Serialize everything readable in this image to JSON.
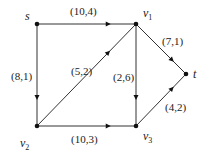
{
  "diagram": {
    "type": "flow-network",
    "nodes": [
      {
        "id": "s",
        "label": "s",
        "sub": "",
        "x": 37,
        "y": 24,
        "lx": 25,
        "ly": 20
      },
      {
        "id": "v1",
        "label": "v",
        "sub": "1",
        "x": 136,
        "y": 24,
        "lx": 143,
        "ly": 17
      },
      {
        "id": "t",
        "label": "t",
        "sub": "",
        "x": 186,
        "y": 74,
        "lx": 193,
        "ly": 78
      },
      {
        "id": "v2",
        "label": "v",
        "sub": "2",
        "x": 37,
        "y": 126,
        "lx": 20,
        "ly": 147
      },
      {
        "id": "v3",
        "label": "v",
        "sub": "3",
        "x": 136,
        "y": 126,
        "lx": 143,
        "ly": 140
      }
    ],
    "edges": [
      {
        "from": "s",
        "to": "v1",
        "label": "(10,4)",
        "lx": 70,
        "ly": 15
      },
      {
        "from": "s",
        "to": "v2",
        "label": "(8,1)",
        "lx": 11,
        "ly": 80
      },
      {
        "from": "v2",
        "to": "v1",
        "label": "(5,2)",
        "lx": 71,
        "ly": 75
      },
      {
        "from": "v1",
        "to": "v3",
        "label": "(2,6)",
        "lx": 113,
        "ly": 81
      },
      {
        "from": "v1",
        "to": "t",
        "label": "(7,1)",
        "lx": 162,
        "ly": 45
      },
      {
        "from": "v2",
        "to": "v3",
        "label": "(10,3)",
        "lx": 71,
        "ly": 143
      },
      {
        "from": "v3",
        "to": "t",
        "label": "(4,2)",
        "lx": 165,
        "ly": 111
      }
    ]
  }
}
